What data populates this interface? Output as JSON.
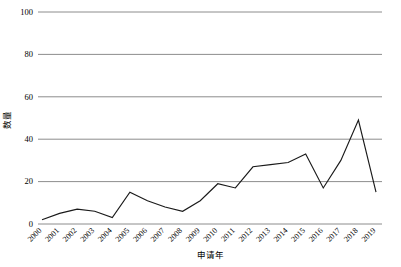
{
  "chart_data": {
    "type": "line",
    "title": "",
    "xlabel": "申请年",
    "ylabel": "数量",
    "categories": [
      "2000",
      "2001",
      "2002",
      "2003",
      "2004",
      "2005",
      "2006",
      "2007",
      "2008",
      "2009",
      "2010",
      "2011",
      "2012",
      "2013",
      "2014",
      "2015",
      "2016",
      "2017",
      "2018",
      "2019"
    ],
    "values": [
      2,
      5,
      7,
      6,
      3,
      15,
      11,
      8,
      6,
      11,
      19,
      17,
      27,
      28,
      29,
      33,
      17,
      30,
      49,
      15
    ],
    "series": [
      {
        "name": "数量",
        "values": [
          2,
          5,
          7,
          6,
          3,
          15,
          11,
          8,
          6,
          11,
          19,
          17,
          27,
          28,
          29,
          33,
          17,
          30,
          49,
          15
        ]
      }
    ],
    "ylim": [
      0,
      100
    ],
    "yticks": [
      0,
      20,
      40,
      60,
      80,
      100
    ],
    "ytick_labels": [
      "0",
      "20",
      "40",
      "60",
      "80",
      "100"
    ],
    "grid": true,
    "grid_axis": "y",
    "legend": false,
    "legend_position": "none",
    "line_color": "#1a1a1a",
    "grid_color": "#808080",
    "background": "#ffffff",
    "xtick_rotation": 45
  }
}
